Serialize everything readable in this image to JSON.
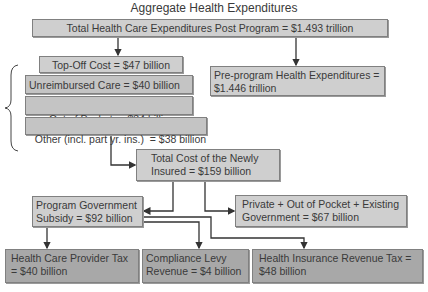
{
  "title": "Aggregate Health Expenditures",
  "nodes": {
    "total_post": "Total Health Care Expenditures Post Program = $1.493 trillion",
    "top_off": "Top-Off Cost = $47 billion",
    "unreimbursed": "Unreimbursed Care = $40 billion",
    "out_of_pocket": "Out of Pocket  = $34 billion",
    "other": "Other (incl. part yr. ins.)  = $38 billion",
    "pre_program": "Pre-program Health Expenditures = $1.446 trillion",
    "newly_insured": "Total Cost of the Newly Insured = $159 billion",
    "private_existing": "Private + Out of Pocket + Existing Government = $67 billion",
    "program_subsidy": "Program Government Subsidy = $92 billion",
    "provider_tax": "Health Care Provider Tax = $40 billion",
    "compliance_levy": "Compliance Levy Revenue = $4 billion",
    "insurance_tax": "Health Insurance Revenue Tax = $48 billion"
  },
  "edges": [
    [
      "total_post",
      "top_off"
    ],
    [
      "total_post",
      "pre_program"
    ],
    [
      "other",
      "newly_insured"
    ],
    [
      "newly_insured",
      "program_subsidy"
    ],
    [
      "newly_insured",
      "private_existing"
    ],
    [
      "program_subsidy",
      "provider_tax"
    ],
    [
      "program_subsidy",
      "compliance_levy"
    ],
    [
      "program_subsidy",
      "insurance_tax"
    ]
  ],
  "colors": {
    "box_fill": "#c4c4c4",
    "box_fill_dark": "#a8a8a8",
    "border": "#808080",
    "line": "#333333"
  }
}
